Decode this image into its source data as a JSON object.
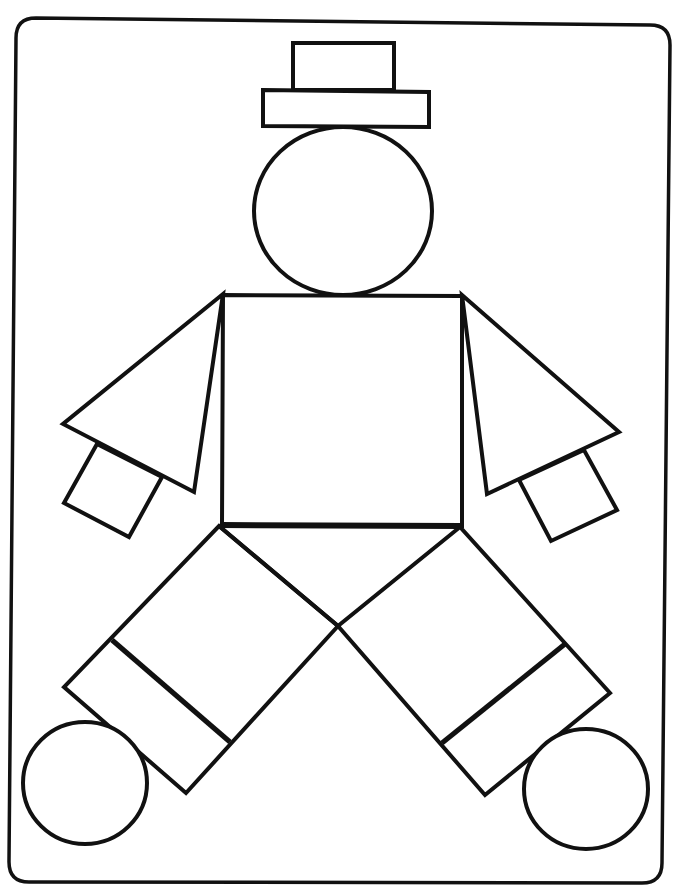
{
  "page": {
    "background": "#ffffff",
    "ink_color": "#111111"
  },
  "figure": {
    "parts": [
      {
        "name": "frame",
        "shape": "rounded-rectangle"
      },
      {
        "name": "hat-crown",
        "shape": "rectangle"
      },
      {
        "name": "hat-brim",
        "shape": "rectangle"
      },
      {
        "name": "head",
        "shape": "circle"
      },
      {
        "name": "body",
        "shape": "square"
      },
      {
        "name": "left-arm",
        "shape": "triangle"
      },
      {
        "name": "right-arm",
        "shape": "triangle"
      },
      {
        "name": "left-hand",
        "shape": "square"
      },
      {
        "name": "right-hand",
        "shape": "square"
      },
      {
        "name": "left-leg",
        "shape": "rectangle"
      },
      {
        "name": "right-leg",
        "shape": "rectangle"
      },
      {
        "name": "left-cuff",
        "shape": "rectangle"
      },
      {
        "name": "right-cuff",
        "shape": "rectangle"
      },
      {
        "name": "left-foot",
        "shape": "circle"
      },
      {
        "name": "right-foot",
        "shape": "circle"
      }
    ]
  }
}
